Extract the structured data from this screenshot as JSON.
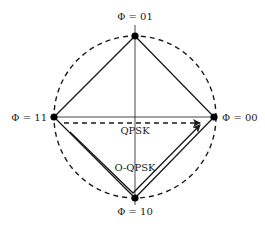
{
  "diagram": {
    "colors": {
      "stroke": "#1a1a1a",
      "background": "#ffffff"
    },
    "constellation_points": [
      {
        "id": "p01",
        "label": "Φ = 01",
        "position": "top"
      },
      {
        "id": "p00",
        "label": "Φ = 00",
        "position": "right"
      },
      {
        "id": "p10",
        "label": "Φ = 10",
        "position": "bottom"
      },
      {
        "id": "p11",
        "label": "Φ = 11",
        "position": "left"
      }
    ],
    "transitions": {
      "qpsk": {
        "label": "QPSK",
        "style": "dashed",
        "from": "11",
        "to": "00"
      },
      "oqpsk": {
        "label": "O-QPSK",
        "style": "solid",
        "from": "11",
        "via": "10",
        "to": "00"
      }
    }
  }
}
